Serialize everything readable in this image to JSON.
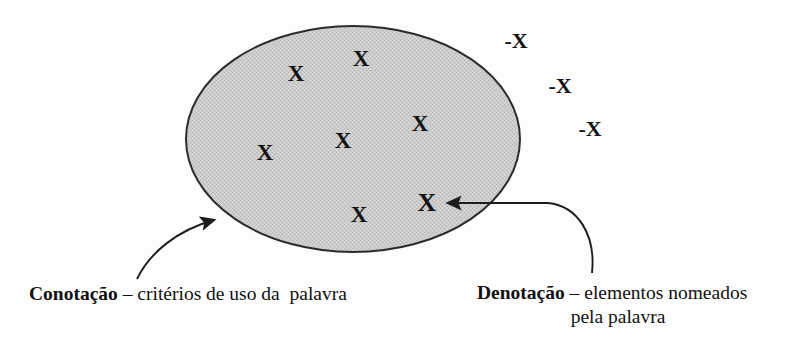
{
  "figure": {
    "background_color": "#fdfdfd",
    "ellipse": {
      "name": "connotation-set",
      "fill_color": "#c9c9c9",
      "stroke_color": "#2b2b2b",
      "cx": 353,
      "cy": 139,
      "rx": 167,
      "ry": 113
    }
  },
  "marks_inside": [
    {
      "label": "X",
      "x": 296,
      "y": 73
    },
    {
      "label": "X",
      "x": 361,
      "y": 58
    },
    {
      "label": "X",
      "x": 420,
      "y": 123
    },
    {
      "label": "X",
      "x": 343,
      "y": 140
    },
    {
      "label": "X",
      "x": 265,
      "y": 152
    },
    {
      "label": "X",
      "x": 359,
      "y": 214
    },
    {
      "label": "X",
      "x": 427,
      "y": 203
    }
  ],
  "marks_outside": [
    {
      "label": "-X",
      "x": 516,
      "y": 41
    },
    {
      "label": "-X",
      "x": 560,
      "y": 86
    },
    {
      "label": "-X",
      "x": 590,
      "y": 129
    }
  ],
  "captions": {
    "left": {
      "term": "Conotação",
      "separator": " – ",
      "description": "critérios de uso da  palavra"
    },
    "right": {
      "term": "Denotação",
      "separator": " – ",
      "description_line1": "elementos nomeados",
      "description_line2": "pela palavra"
    }
  },
  "arrows": [
    {
      "name": "connotation-arrow",
      "from_x": 137,
      "from_y": 278,
      "to_x": 222,
      "to_y": 218,
      "color": "#1d1d1d"
    },
    {
      "name": "denotation-arrow",
      "from_x": 592,
      "from_y": 273,
      "to_x": 437,
      "to_y": 203,
      "color": "#1d1d1d"
    }
  ]
}
